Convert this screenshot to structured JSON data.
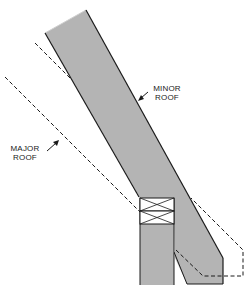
{
  "diagram": {
    "type": "roof framing cross-section",
    "labels": {
      "minor_roof_line1": "MINOR",
      "minor_roof_line2": "ROOF",
      "major_roof_line1": "MAJOR",
      "major_roof_line2": "ROOF"
    },
    "colors": {
      "fill_gray": "#b4b4b4",
      "stroke": "#1a1a1a",
      "background": "#ffffff"
    },
    "elements": [
      "minor-roof-rafter (gray beam)",
      "wall-post (gray)",
      "cross-bracing blocks (2)",
      "major-roof dashed outline"
    ]
  }
}
